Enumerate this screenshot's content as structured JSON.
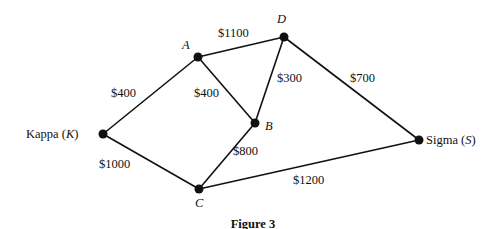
{
  "figure": {
    "caption": "Figure 3",
    "nodes": [
      {
        "id": "A",
        "label": "A",
        "x": 198,
        "y": 57
      },
      {
        "id": "D",
        "label": "D",
        "x": 284,
        "y": 37
      },
      {
        "id": "B",
        "label": "B",
        "x": 255,
        "y": 123
      },
      {
        "id": "K",
        "label": "Kappa (K)",
        "name": "Kappa",
        "abbr": "K",
        "x": 103,
        "y": 134
      },
      {
        "id": "C",
        "label": "C",
        "x": 199,
        "y": 189
      },
      {
        "id": "S",
        "label": "Sigma (S)",
        "name": "Sigma",
        "abbr": "S",
        "x": 419,
        "y": 140
      }
    ],
    "edges": [
      {
        "from": "K",
        "to": "A",
        "cost": "$400"
      },
      {
        "from": "A",
        "to": "D",
        "cost": "$1100"
      },
      {
        "from": "A",
        "to": "B",
        "cost": "$400"
      },
      {
        "from": "D",
        "to": "B",
        "cost": "$300"
      },
      {
        "from": "D",
        "to": "S",
        "cost": "$700"
      },
      {
        "from": "K",
        "to": "C",
        "cost": "$1000"
      },
      {
        "from": "B",
        "to": "C",
        "cost": "$800"
      },
      {
        "from": "C",
        "to": "S",
        "cost": "$1200"
      }
    ]
  },
  "labels": {
    "kappa_name": "Kappa (",
    "kappa_abbr": "K",
    "kappa_close": ")",
    "sigma_name": "Sigma (",
    "sigma_abbr": "S",
    "sigma_close": ")",
    "A": "A",
    "B": "B",
    "C": "C",
    "D": "D",
    "e_KA": "$400",
    "e_AD": "$1100",
    "e_AB": "$400",
    "e_DB": "$300",
    "e_DS": "$700",
    "e_KC": "$1000",
    "e_BC": "$800",
    "e_CS": "$1200"
  }
}
